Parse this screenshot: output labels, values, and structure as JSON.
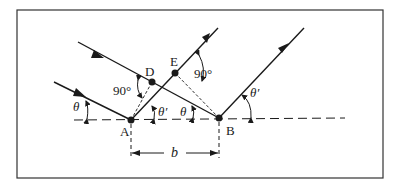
{
  "diagram": {
    "points": {
      "A": {
        "label": "A"
      },
      "B": {
        "label": "B"
      },
      "D": {
        "label": "D"
      },
      "E": {
        "label": "E"
      }
    },
    "angles": {
      "incident_left": "θ",
      "reflected_A": "θ′",
      "incident_B": "θ",
      "reflected_B": "θ′",
      "right_angle_D": "90°",
      "right_angle_E": "90°"
    },
    "distance": {
      "label": "b"
    },
    "colors": {
      "ink": "#1a1a1a",
      "frame": "#333333",
      "background": "#ffffff"
    }
  }
}
